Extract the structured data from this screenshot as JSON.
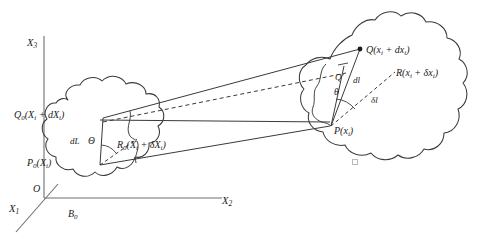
{
  "figure": {
    "stroke_color": "#3a3a3a",
    "text_color": "#1a1a1a",
    "background": "#ffffff"
  },
  "axes": {
    "x1": "X",
    "x1_sub": "1",
    "x2": "X",
    "x2_sub": "2",
    "x3": "X",
    "x3_sub": "3",
    "origin": "O"
  },
  "reference_body": {
    "name": "B",
    "name_sub": "0",
    "points": {
      "p0": {
        "symbol": "P",
        "sub": "0",
        "coords": "(X",
        "coords_sub": "i",
        "coords_end": ")"
      },
      "q0_full": "Q",
      "r0_full": "R"
    },
    "labels": {
      "p0": "P₀(X𝑖)",
      "q0": "Q₀(X𝑖 + dX𝑖)",
      "r0": "R₀(X𝑖 + δX𝑖)",
      "dL": "dL",
      "theta_cap": "Θ"
    }
  },
  "current_body": {
    "labels": {
      "p": "P(x𝑖)",
      "q": "Q(x𝑖 + dx𝑖)",
      "r": "R(x𝑖 + δx𝑖)",
      "dl": "dl",
      "delta_l": "δl",
      "theta": "θ",
      "q_prime": "Q′"
    }
  },
  "label_parts": {
    "P0": {
      "base": "P",
      "sub": "0",
      "arg_open": "(X",
      "arg_sub": "i",
      "arg_close": ")"
    },
    "Q0": {
      "base": "Q",
      "sub": "0",
      "arg_open": "(X",
      "arg_sub1": "i",
      "plus": " + d",
      "arg2": "X",
      "arg_sub2": "i",
      "arg_close": ")"
    },
    "R0": {
      "base": "R",
      "sub": "0",
      "arg_open": "(X",
      "arg_sub1": "i",
      "plus": " + δ",
      "arg2": "X",
      "arg_sub2": "i",
      "arg_close": ")"
    },
    "P": {
      "base": "P",
      "arg_open": "(x",
      "arg_sub": "i",
      "arg_close": ")"
    },
    "Q": {
      "base": "Q",
      "arg_open": "(x",
      "arg_sub1": "i",
      "plus": " + d",
      "arg2": "x",
      "arg_sub2": "i",
      "arg_close": ")"
    },
    "R": {
      "base": "R",
      "arg_open": "(x",
      "arg_sub1": "i",
      "plus": " + δ",
      "arg2": "x",
      "arg_sub2": "i",
      "arg_close": ")"
    }
  }
}
